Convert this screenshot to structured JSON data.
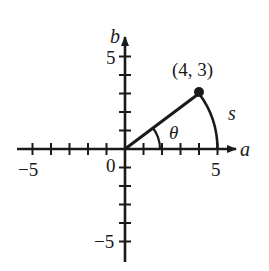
{
  "diagram": {
    "type": "coordinate-plane",
    "axes": {
      "x_label": "a",
      "y_label": "b",
      "x_range": [
        -5,
        5
      ],
      "y_range": [
        -5,
        5
      ],
      "tick_step": 1
    },
    "tick_labels": {
      "x_neg": "−5",
      "x_pos": "5",
      "origin": "0",
      "y_pos": "5",
      "y_neg": "−5"
    },
    "point": {
      "label": "(4, 3)",
      "x": 4,
      "y": 3
    },
    "angle_label": "θ",
    "arc_label": "s",
    "colors": {
      "ink": "#1a1a1a",
      "background": "#ffffff"
    }
  }
}
